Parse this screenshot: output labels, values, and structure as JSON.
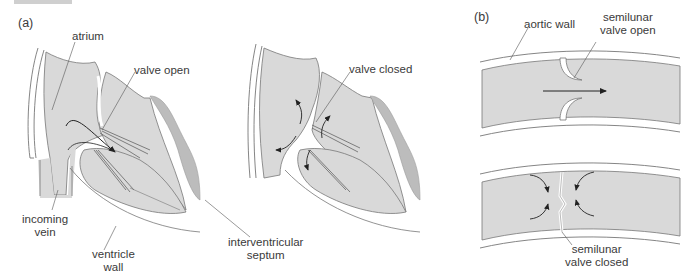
{
  "figure": {
    "panels": [
      {
        "id": "a",
        "label": "(a)"
      },
      {
        "id": "b",
        "label": "(b)"
      }
    ],
    "labels_a": {
      "atrium": "atrium",
      "valve_open": "valve open",
      "valve_closed": "valve closed",
      "incoming_vein_1": "incoming",
      "incoming_vein_2": "vein",
      "ventricle_wall_1": "ventricle",
      "ventricle_wall_2": "wall",
      "septum_1": "interventricular",
      "septum_2": "septum"
    },
    "labels_b": {
      "aortic_wall": "aortic wall",
      "semilunar_open_1": "semilunar",
      "semilunar_open_2": "valve open",
      "semilunar_closed_1": "semilunar",
      "semilunar_closed_2": "valve closed"
    },
    "colors": {
      "tissue": "#d9d9d9",
      "septum": "#bcbcbc",
      "wall": "#ffffff",
      "outline": "#6e6e6e",
      "arrow": "#222222"
    }
  }
}
